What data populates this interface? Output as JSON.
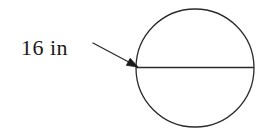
{
  "figure": {
    "background_color": "#ffffff",
    "stroke_color": "#2b2b2b",
    "text_color": "#1a1a1a",
    "label": {
      "text": "16 in",
      "value": "16",
      "unit": "in",
      "x": 21,
      "y": 36,
      "font_size": 22
    },
    "circle": {
      "center_x": 195,
      "center_y": 68,
      "radius": 59,
      "stroke_width": 1.3
    },
    "diameter_line": {
      "x1": 136,
      "y1": 67.5,
      "x2": 254,
      "y2": 67.5,
      "stroke_width": 1.3,
      "measures": "16 in"
    },
    "leader_arrow": {
      "tail_x": 93,
      "tail_y": 43,
      "tip_x": 138,
      "tip_y": 67,
      "stroke_width": 1.3,
      "head_length": 11,
      "head_width": 8,
      "points_to": "diameter-line"
    }
  }
}
